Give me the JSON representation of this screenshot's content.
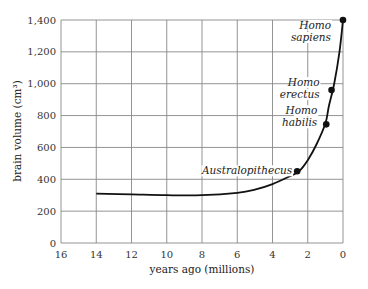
{
  "chart_data": {
    "type": "line",
    "title": "",
    "xlabel": "years ago (millions)",
    "ylabel": "brain volume (cm³)",
    "xlim": [
      16,
      0
    ],
    "ylim": [
      0,
      1400
    ],
    "x_ticks": [
      "16",
      "14",
      "12",
      "10",
      "8",
      "6",
      "4",
      "2",
      "0"
    ],
    "y_ticks": [
      "0",
      "200",
      "400",
      "600",
      "800",
      "1,000",
      "1,200",
      "1,400"
    ],
    "grid": true,
    "curve": {
      "x": [
        14,
        12,
        10,
        8,
        6,
        5,
        4,
        3,
        2.5,
        2,
        1.5,
        1,
        0.8,
        0.5,
        0.2,
        0
      ],
      "y": [
        310,
        305,
        300,
        300,
        315,
        335,
        370,
        420,
        450,
        520,
        620,
        750,
        860,
        1000,
        1200,
        1400
      ]
    },
    "points": [
      {
        "label": "Australopithecus",
        "x": 2.6,
        "y": 450
      },
      {
        "label": "Homo habilis",
        "x": 0.95,
        "y": 745
      },
      {
        "label": "Homo erectus",
        "x": 0.65,
        "y": 960
      },
      {
        "label": "Homo sapiens",
        "x": 0.0,
        "y": 1400
      }
    ]
  }
}
